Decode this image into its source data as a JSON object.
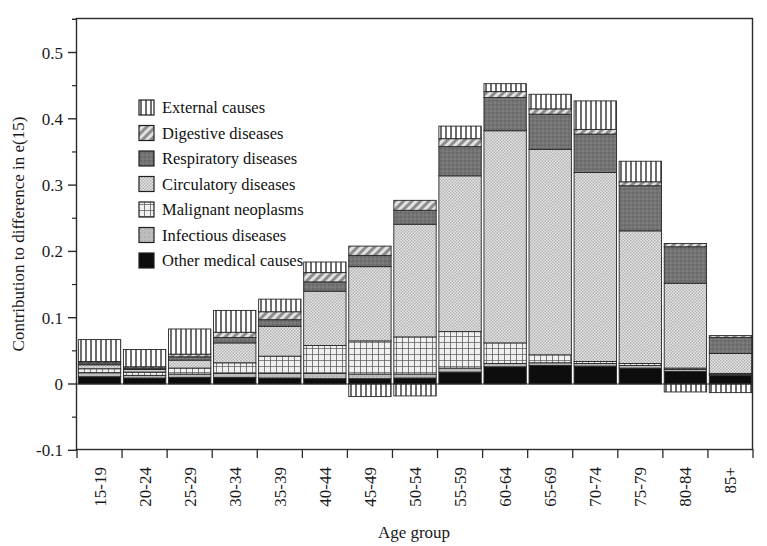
{
  "chart_data": {
    "type": "bar",
    "stacked": true,
    "title": "",
    "xlabel": "Age group",
    "ylabel": "Contribution to difference in e(15)",
    "ylim": [
      -0.1,
      0.55
    ],
    "yticks": [
      -0.1,
      0,
      0.1,
      0.2,
      0.3,
      0.4,
      0.5
    ],
    "ytick_labels": [
      "-0.1",
      "0",
      "0.1",
      "0.2",
      "0.3",
      "0.4",
      "0.5"
    ],
    "minor_ticks": true,
    "grid": false,
    "legend_position": "upper-left-inside",
    "categories": [
      "15-19",
      "20-24",
      "25-29",
      "30-34",
      "35-39",
      "40-44",
      "45-49",
      "50-54",
      "55-59",
      "60-64",
      "65-69",
      "70-74",
      "75-79",
      "80-84",
      "85+"
    ],
    "series": [
      {
        "name": "Other medical causes",
        "pattern": "solid-black",
        "color": "#0a0a0a",
        "values": [
          0.011,
          0.009,
          0.01,
          0.01,
          0.009,
          0.008,
          0.008,
          0.009,
          0.018,
          0.026,
          0.028,
          0.027,
          0.024,
          0.019,
          0.013
        ]
      },
      {
        "name": "Infectious diseases",
        "pattern": "solid-lightgray",
        "color": "#b8b8b8",
        "values": [
          0.006,
          0.004,
          0.005,
          0.006,
          0.007,
          0.008,
          0.007,
          0.006,
          0.006,
          0.005,
          0.004,
          0.004,
          0.004,
          0.003,
          0.002
        ]
      },
      {
        "name": "Malignant neoplasms",
        "pattern": "grid",
        "color": "#9a9a9a",
        "values": [
          0.006,
          0.005,
          0.009,
          0.016,
          0.026,
          0.042,
          0.05,
          0.056,
          0.055,
          0.031,
          0.012,
          0.003,
          0.003,
          0.002,
          0.001
        ]
      },
      {
        "name": "Circulatory diseases",
        "pattern": "fine-dot",
        "color": "#d9d9d9",
        "values": [
          0.006,
          0.004,
          0.012,
          0.03,
          0.045,
          0.082,
          0.112,
          0.17,
          0.235,
          0.32,
          0.31,
          0.285,
          0.2,
          0.128,
          0.03
        ]
      },
      {
        "name": "Respiratory diseases",
        "pattern": "solid-darkgray",
        "color": "#7a7a7a",
        "values": [
          0.003,
          0.002,
          0.005,
          0.008,
          0.01,
          0.014,
          0.017,
          0.021,
          0.044,
          0.05,
          0.053,
          0.058,
          0.068,
          0.055,
          0.024
        ]
      },
      {
        "name": "Digestive diseases",
        "pattern": "diagonal",
        "color": "#c4c4c4",
        "values": [
          0.002,
          0.002,
          0.004,
          0.008,
          0.012,
          0.014,
          0.014,
          0.015,
          0.012,
          0.009,
          0.008,
          0.007,
          0.006,
          0.005,
          0.003
        ]
      },
      {
        "name": "External causes",
        "pattern": "vertical",
        "color": "#cfcfcf",
        "values": [
          0.033,
          0.026,
          0.038,
          0.033,
          0.019,
          0.016,
          -0.019,
          -0.018,
          0.019,
          0.012,
          0.022,
          0.043,
          0.031,
          -0.012,
          -0.013
        ]
      }
    ],
    "annotations": []
  },
  "legend": {
    "items": [
      {
        "label": "External causes"
      },
      {
        "label": "Digestive diseases"
      },
      {
        "label": "Respiratory diseases"
      },
      {
        "label": "Circulatory diseases"
      },
      {
        "label": "Malignant neoplasms"
      },
      {
        "label": "Infectious diseases"
      },
      {
        "label": "Other medical causes"
      }
    ]
  }
}
